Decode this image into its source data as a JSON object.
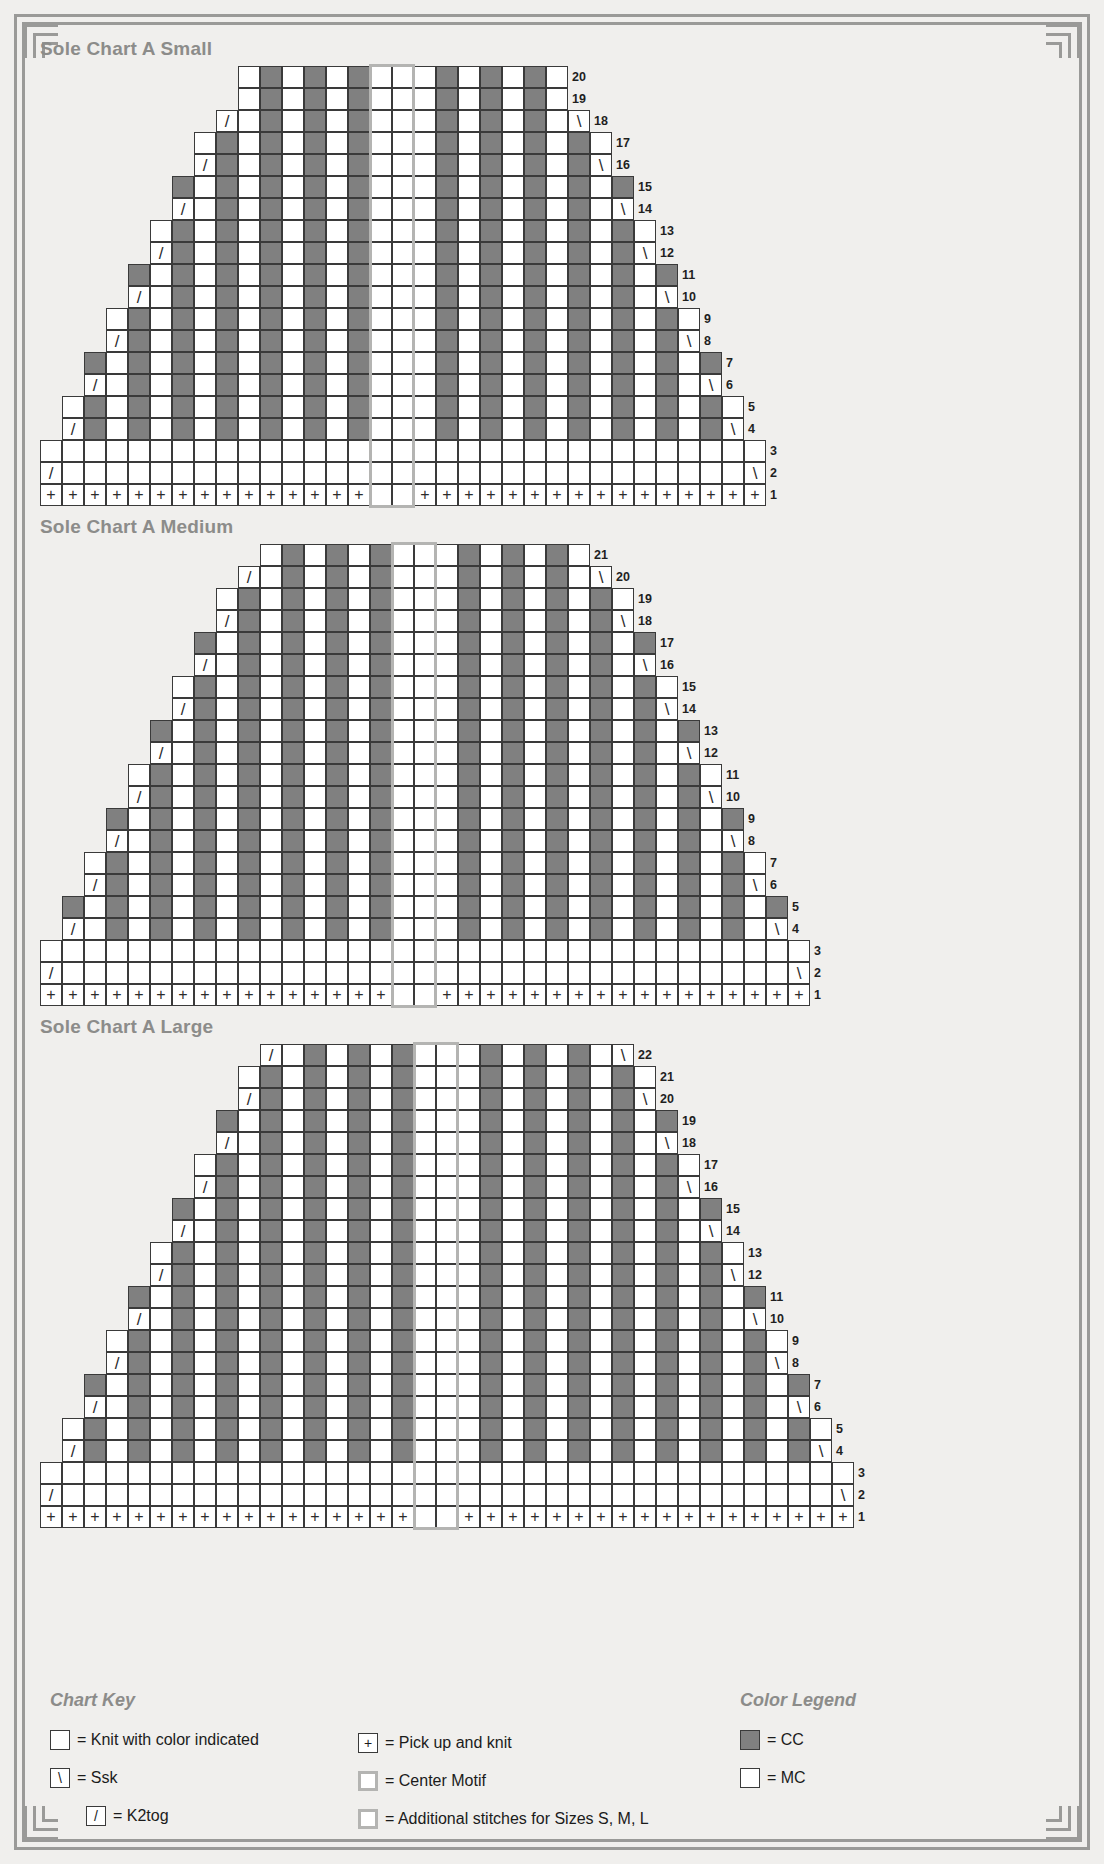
{
  "document": {
    "charts": [
      {
        "title": "Sole Chart A Small",
        "rows": 20,
        "width": 33,
        "row_numbers": [
          1,
          2,
          3,
          4,
          5,
          6,
          7,
          8,
          9,
          10,
          11,
          12,
          13,
          14,
          15,
          16,
          17,
          18,
          19,
          20
        ]
      },
      {
        "title": "Sole Chart A Medium",
        "rows": 21,
        "width": 35,
        "row_numbers": [
          1,
          2,
          3,
          4,
          5,
          6,
          7,
          8,
          9,
          10,
          11,
          12,
          13,
          14,
          15,
          16,
          17,
          18,
          19,
          20,
          21
        ]
      },
      {
        "title": "Sole Chart A Large",
        "rows": 22,
        "width": 37,
        "row_numbers": [
          1,
          2,
          3,
          4,
          5,
          6,
          7,
          8,
          9,
          10,
          11,
          12,
          13,
          14,
          15,
          16,
          17,
          18,
          19,
          20,
          21,
          22
        ]
      }
    ]
  },
  "chart_key": {
    "heading": "Chart Key",
    "items": [
      {
        "symbol": "",
        "swatch": "white",
        "label": "= Knit with color indicated"
      },
      {
        "symbol": "\\",
        "swatch": "white",
        "label": "= Ssk"
      },
      {
        "symbol": "/",
        "swatch": "white",
        "label": "= K2tog"
      },
      {
        "symbol": "+",
        "swatch": "white",
        "label": "= Pick up and knit"
      },
      {
        "symbol": "",
        "swatch": "thick",
        "label": "= Center Motif"
      },
      {
        "symbol": "",
        "swatch": "thick",
        "label": "= Additional stitches for Sizes S, M, L"
      }
    ]
  },
  "color_legend": {
    "heading": "Color Legend",
    "items": [
      {
        "swatch": "grey",
        "color": "#808080",
        "label": "= CC"
      },
      {
        "swatch": "white",
        "color": "#ffffff",
        "label": "= MC"
      }
    ]
  },
  "colors": {
    "page_background": "#f0efed",
    "frame": "#9a9a98",
    "title_text": "#8c8c8a",
    "cc": "#808080",
    "mc": "#ffffff",
    "cell_border": "#3a3a3a",
    "highlight": "#b4b4b2",
    "body_text": "#1b1b1b"
  },
  "chart_data": {
    "type": "heatmap",
    "xlabel": "Stitches",
    "ylabel": "Rows",
    "grid": true,
    "legend_position": "bottom",
    "cell_values": {
      "mc": "MC (white)",
      "cc": "CC (grey)",
      "blank": "no stitch"
    },
    "symbols": {
      "+": "Pick up and knit",
      "/": "K2tog",
      "\\": "Ssk"
    },
    "charts": [
      {
        "name": "Sole Chart A Small",
        "stitch_width": 33,
        "row_count": 20,
        "center_motif_columns": [
          16,
          17
        ],
        "rows": [
          {
            "row": 1,
            "indent_left": 0,
            "indent_right": 0,
            "pattern": "++++++++++++++++ +++++++++++++++++",
            "note": "pick up and knit across, center motif blank"
          },
          {
            "row": 2,
            "indent_left": 0,
            "indent_right": 0,
            "left_sym": "/",
            "right_sym": "\\"
          },
          {
            "row": 3,
            "indent_left": 0,
            "indent_right": 0
          },
          {
            "row": 4,
            "indent_left": 1,
            "indent_right": 1,
            "left_sym": "/",
            "right_sym": "\\"
          },
          {
            "row": 5,
            "indent_left": 1,
            "indent_right": 1
          },
          {
            "row": 6,
            "indent_left": 2,
            "indent_right": 2,
            "left_sym": "/",
            "right_sym": "\\"
          },
          {
            "row": 7,
            "indent_left": 2,
            "indent_right": 2
          },
          {
            "row": 8,
            "indent_left": 3,
            "indent_right": 3,
            "left_sym": "/",
            "right_sym": "\\"
          },
          {
            "row": 9,
            "indent_left": 3,
            "indent_right": 3
          },
          {
            "row": 10,
            "indent_left": 4,
            "indent_right": 4,
            "left_sym": "/",
            "right_sym": "\\"
          },
          {
            "row": 11,
            "indent_left": 4,
            "indent_right": 4
          },
          {
            "row": 12,
            "indent_left": 5,
            "indent_right": 5,
            "left_sym": "/",
            "right_sym": "\\"
          },
          {
            "row": 13,
            "indent_left": 5,
            "indent_right": 5
          },
          {
            "row": 14,
            "indent_left": 6,
            "indent_right": 6,
            "left_sym": "/",
            "right_sym": "\\"
          },
          {
            "row": 15,
            "indent_left": 6,
            "indent_right": 6
          },
          {
            "row": 16,
            "indent_left": 7,
            "indent_right": 7,
            "left_sym": "/",
            "right_sym": "\\"
          },
          {
            "row": 17,
            "indent_left": 7,
            "indent_right": 7
          },
          {
            "row": 18,
            "indent_left": 8,
            "indent_right": 8,
            "left_sym": "/",
            "right_sym": "\\"
          },
          {
            "row": 19,
            "indent_left": 9,
            "indent_right": 9
          },
          {
            "row": 20,
            "indent_left": 9,
            "indent_right": 9
          }
        ]
      },
      {
        "name": "Sole Chart A Medium",
        "stitch_width": 35,
        "row_count": 21,
        "center_motif_columns": [
          17,
          18
        ],
        "rows": [
          {
            "row": 1,
            "indent_left": 0,
            "indent_right": 0,
            "pattern": "pick up and knit"
          },
          {
            "row": 2,
            "indent_left": 0,
            "indent_right": 0,
            "left_sym": "/",
            "right_sym": "\\"
          },
          {
            "row": 3,
            "indent_left": 0,
            "indent_right": 0
          },
          {
            "row": 4,
            "indent_left": 1,
            "indent_right": 1,
            "left_sym": "/",
            "right_sym": "\\"
          },
          {
            "row": 5,
            "indent_left": 1,
            "indent_right": 1
          },
          {
            "row": 6,
            "indent_left": 2,
            "indent_right": 2,
            "left_sym": "/",
            "right_sym": "\\"
          },
          {
            "row": 7,
            "indent_left": 2,
            "indent_right": 2
          },
          {
            "row": 8,
            "indent_left": 3,
            "indent_right": 3,
            "left_sym": "/",
            "right_sym": "\\"
          },
          {
            "row": 9,
            "indent_left": 3,
            "indent_right": 3
          },
          {
            "row": 10,
            "indent_left": 4,
            "indent_right": 4,
            "left_sym": "/",
            "right_sym": "\\"
          },
          {
            "row": 11,
            "indent_left": 4,
            "indent_right": 4
          },
          {
            "row": 12,
            "indent_left": 5,
            "indent_right": 5,
            "left_sym": "/",
            "right_sym": "\\"
          },
          {
            "row": 13,
            "indent_left": 5,
            "indent_right": 5
          },
          {
            "row": 14,
            "indent_left": 6,
            "indent_right": 6,
            "left_sym": "/",
            "right_sym": "\\"
          },
          {
            "row": 15,
            "indent_left": 6,
            "indent_right": 6
          },
          {
            "row": 16,
            "indent_left": 7,
            "indent_right": 7,
            "left_sym": "/",
            "right_sym": "\\"
          },
          {
            "row": 17,
            "indent_left": 7,
            "indent_right": 7
          },
          {
            "row": 18,
            "indent_left": 8,
            "indent_right": 8,
            "left_sym": "/",
            "right_sym": "\\"
          },
          {
            "row": 19,
            "indent_left": 8,
            "indent_right": 8
          },
          {
            "row": 20,
            "indent_left": 9,
            "indent_right": 9,
            "left_sym": "/",
            "right_sym": "\\"
          },
          {
            "row": 21,
            "indent_left": 10,
            "indent_right": 10
          }
        ]
      },
      {
        "name": "Sole Chart A Large",
        "stitch_width": 37,
        "row_count": 22,
        "center_motif_columns": [
          18,
          19
        ],
        "rows": [
          {
            "row": 1,
            "indent_left": 0,
            "indent_right": 0,
            "pattern": "pick up and knit"
          },
          {
            "row": 2,
            "indent_left": 0,
            "indent_right": 0,
            "left_sym": "/",
            "right_sym": "\\"
          },
          {
            "row": 3,
            "indent_left": 0,
            "indent_right": 0
          },
          {
            "row": 4,
            "indent_left": 1,
            "indent_right": 1,
            "left_sym": "/",
            "right_sym": "\\"
          },
          {
            "row": 5,
            "indent_left": 1,
            "indent_right": 1
          },
          {
            "row": 6,
            "indent_left": 2,
            "indent_right": 2,
            "left_sym": "/",
            "right_sym": "\\"
          },
          {
            "row": 7,
            "indent_left": 2,
            "indent_right": 2
          },
          {
            "row": 8,
            "indent_left": 3,
            "indent_right": 3,
            "left_sym": "/",
            "right_sym": "\\"
          },
          {
            "row": 9,
            "indent_left": 3,
            "indent_right": 3
          },
          {
            "row": 10,
            "indent_left": 4,
            "indent_right": 4,
            "left_sym": "/",
            "right_sym": "\\"
          },
          {
            "row": 11,
            "indent_left": 4,
            "indent_right": 4
          },
          {
            "row": 12,
            "indent_left": 5,
            "indent_right": 5,
            "left_sym": "/",
            "right_sym": "\\"
          },
          {
            "row": 13,
            "indent_left": 5,
            "indent_right": 5
          },
          {
            "row": 14,
            "indent_left": 6,
            "indent_right": 6,
            "left_sym": "/",
            "right_sym": "\\"
          },
          {
            "row": 15,
            "indent_left": 6,
            "indent_right": 6
          },
          {
            "row": 16,
            "indent_left": 7,
            "indent_right": 7,
            "left_sym": "/",
            "right_sym": "\\"
          },
          {
            "row": 17,
            "indent_left": 7,
            "indent_right": 7
          },
          {
            "row": 18,
            "indent_left": 8,
            "indent_right": 8,
            "left_sym": "/",
            "right_sym": "\\"
          },
          {
            "row": 19,
            "indent_left": 8,
            "indent_right": 8
          },
          {
            "row": 20,
            "indent_left": 9,
            "indent_right": 9,
            "left_sym": "/",
            "right_sym": "\\"
          },
          {
            "row": 21,
            "indent_left": 9,
            "indent_right": 9
          },
          {
            "row": 22,
            "indent_left": 10,
            "indent_right": 10,
            "left_sym": "/",
            "right_sym": "\\"
          }
        ]
      }
    ]
  }
}
